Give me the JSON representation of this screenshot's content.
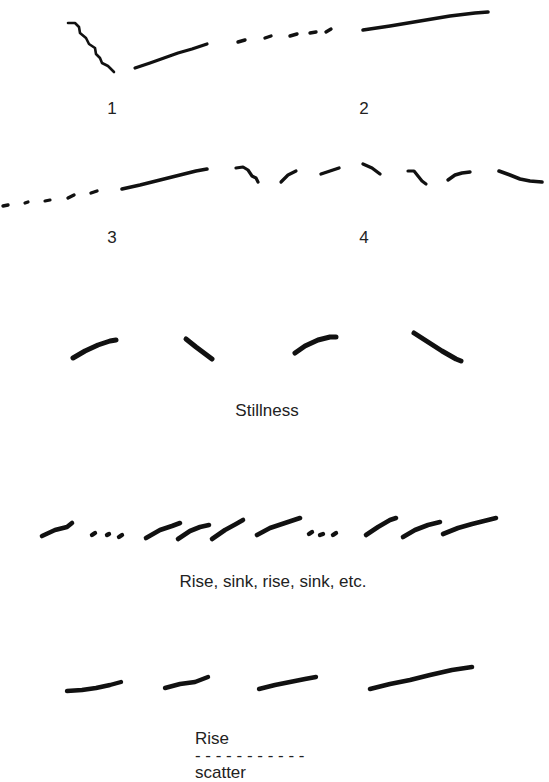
{
  "diagram": {
    "ink_color": "#111111",
    "text_color": "#222222",
    "background": "#ffffff",
    "panels": [
      {
        "id": "1",
        "label": "1",
        "label_pos": [
          112,
          100
        ],
        "strokes": [
          {
            "w": 2.6,
            "d": "M68,23 L75,23 L79,27 L80,33 L86,38 L89,44 L95,48 L96,54 L100,58 L102,63 L108,66 L114,72"
          },
          {
            "w": 3.2,
            "d": "M135,68 L150,63 L164,58 L178,53 L192,49 L207,44"
          }
        ]
      },
      {
        "id": "2",
        "label": "2",
        "label_pos": [
          364,
          100
        ],
        "strokes": [
          {
            "w": 3.4,
            "d": "M238,42 L245,40"
          },
          {
            "w": 3.4,
            "d": "M265,38 L271,36"
          },
          {
            "w": 3.4,
            "d": "M290,36 L297,34"
          },
          {
            "w": 3.4,
            "d": "M310,33 L316,32"
          },
          {
            "w": 3.4,
            "d": "M326,32 L331,29"
          },
          {
            "w": 3.6,
            "d": "M363,30 L390,26 L420,21 L450,16 L475,13 L488,12"
          }
        ]
      },
      {
        "id": "3",
        "label": "3",
        "label_pos": [
          112,
          229
        ],
        "strokes": [
          {
            "w": 3.4,
            "d": "M3,206 L8,205"
          },
          {
            "w": 3.2,
            "d": "M25,203 L28,202"
          },
          {
            "w": 3.2,
            "d": "M45,201 L50,200"
          },
          {
            "w": 3.4,
            "d": "M68,198 L74,195"
          },
          {
            "w": 3.4,
            "d": "M91,193 L97,191"
          },
          {
            "w": 3.6,
            "d": "M122,189 L140,185 L160,180 L180,175 L196,171 L207,169"
          }
        ]
      },
      {
        "id": "4",
        "label": "4",
        "label_pos": [
          364,
          229
        ],
        "strokes": [
          {
            "w": 3.2,
            "d": "M236,168 L243,167 L248,170 L252,176 L256,178 L258,182"
          },
          {
            "w": 3.2,
            "d": "M281,182 L288,175 L296,171"
          },
          {
            "w": 3.4,
            "d": "M321,174 L333,170 L339,168"
          },
          {
            "w": 3.4,
            "d": "M363,164 L372,168 L380,174"
          },
          {
            "w": 3.2,
            "d": "M408,171 L414,171 L418,176 L422,181 L426,184"
          },
          {
            "w": 3.4,
            "d": "M448,180 L455,175 L462,173 L470,172"
          },
          {
            "w": 3.6,
            "d": "M499,171 L510,175 L520,179 L530,181 L542,182"
          }
        ]
      },
      {
        "id": "stillness",
        "label": "Stillness",
        "label_pos": [
          267,
          402
        ],
        "strokes": [
          {
            "w": 5.0,
            "d": "M73,358 L85,351 L98,345 L110,341 L116,340"
          },
          {
            "w": 5.0,
            "d": "M186,339 L196,347 L204,353 L212,359"
          },
          {
            "w": 5.0,
            "d": "M295,353 L305,346 L318,340 L330,337 L336,337"
          },
          {
            "w": 5.0,
            "d": "M414,333 L428,342 L442,351 L456,359 L461,361"
          }
        ]
      },
      {
        "id": "rise-sink",
        "label": "Rise, sink, rise, sink, etc.",
        "label_pos": [
          273,
          573
        ],
        "strokes": [
          {
            "w": 4.6,
            "d": "M42,536 L55,530 L67,527 L72,523"
          },
          {
            "w": 4.4,
            "d": "M92,535 L95,533"
          },
          {
            "w": 4.4,
            "d": "M107,535 L109,534"
          },
          {
            "w": 4.4,
            "d": "M119,537 L122,535"
          },
          {
            "w": 4.6,
            "d": "M146,538 L160,530 L172,526 L180,523"
          },
          {
            "w": 4.6,
            "d": "M178,539 L190,531 L200,527 L209,525"
          },
          {
            "w": 4.6,
            "d": "M212,539 L225,530 L236,524 L243,520"
          },
          {
            "w": 4.6,
            "d": "M257,535 L270,528 L285,523 L300,518"
          },
          {
            "w": 4.4,
            "d": "M309,534 L312,532"
          },
          {
            "w": 4.4,
            "d": "M320,535 L323,534"
          },
          {
            "w": 4.4,
            "d": "M333,535 L336,533"
          },
          {
            "w": 4.6,
            "d": "M366,535 L378,527 L390,520 L396,518"
          },
          {
            "w": 4.6,
            "d": "M403,537 L415,530 L428,525 L440,522"
          },
          {
            "w": 4.6,
            "d": "M443,534 L458,528 L472,524 L484,521 L496,518"
          }
        ]
      },
      {
        "id": "rise-scatter",
        "label_parts": {
          "start": "Rise",
          "dashes": "- - - - - - - - - - -",
          "end": "scatter"
        },
        "label_pos": [
          245,
          713
        ],
        "strokes": [
          {
            "w": 4.4,
            "d": "M67,691 L82,690 L96,688 L110,685 L121,682"
          },
          {
            "w": 4.4,
            "d": "M165,688 L180,684 L195,682 L208,677"
          },
          {
            "w": 4.4,
            "d": "M259,689 L275,685 L290,682 L305,679 L316,677"
          },
          {
            "w": 4.6,
            "d": "M370,689 L390,684 L410,680 L430,675 L452,670 L472,667"
          }
        ]
      }
    ]
  }
}
